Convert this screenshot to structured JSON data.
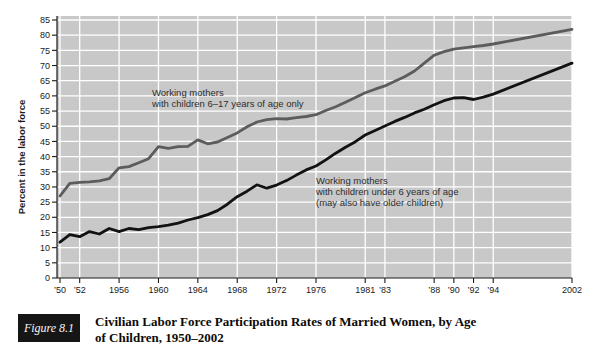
{
  "figure": {
    "label": "Figure 8.1",
    "caption_line1": "Civilian Labor Force Participation Rates of Married Women, by Age",
    "caption_line2": "of Children, 1950–2002"
  },
  "chart_data": {
    "type": "line",
    "title": "",
    "xlabel": "",
    "ylabel": "Percent in the labor force",
    "ylim": [
      0,
      85
    ],
    "yticks": [
      0,
      5,
      10,
      15,
      20,
      25,
      30,
      35,
      40,
      45,
      50,
      55,
      60,
      65,
      70,
      75,
      80,
      85
    ],
    "xlim": [
      1950,
      2002
    ],
    "xticks": [
      {
        "year": 1950,
        "label": "’50"
      },
      {
        "year": 1952,
        "label": "’52"
      },
      {
        "year": 1956,
        "label": "1956"
      },
      {
        "year": 1960,
        "label": "1960"
      },
      {
        "year": 1964,
        "label": "1964"
      },
      {
        "year": 1968,
        "label": "1968"
      },
      {
        "year": 1972,
        "label": "1972"
      },
      {
        "year": 1976,
        "label": "1976"
      },
      {
        "year": 1981,
        "label": "1981"
      },
      {
        "year": 1983,
        "label": "’83"
      },
      {
        "year": 1988,
        "label": "’88"
      },
      {
        "year": 1990,
        "label": "’90"
      },
      {
        "year": 1992,
        "label": "’92"
      },
      {
        "year": 1994,
        "label": "’94"
      },
      {
        "year": 2002,
        "label": "2002"
      }
    ],
    "grid": "white gridlines on gray plot background, horizontal every 5 units, vertical at labeled years",
    "legend_position": "inline annotations on plot",
    "colors": {
      "plot_bg": "#c8c8c8",
      "grid": "#ffffff",
      "axis": "#1a1a1a",
      "annotation_text": "#2e2e2e",
      "caption_box_bg": "#161616",
      "caption_box_text": "#f5f5f5"
    },
    "series": [
      {
        "name": "Working mothers with children 6–17 years of age only",
        "color": "#5c5c5c",
        "points": [
          [
            1950,
            27
          ],
          [
            1951,
            31.2
          ],
          [
            1952,
            31.5
          ],
          [
            1953,
            31.7
          ],
          [
            1954,
            32
          ],
          [
            1955,
            32.7
          ],
          [
            1956,
            36.3
          ],
          [
            1957,
            36.7
          ],
          [
            1958,
            38
          ],
          [
            1959,
            39.3
          ],
          [
            1960,
            43.3
          ],
          [
            1961,
            42.7
          ],
          [
            1962,
            43.3
          ],
          [
            1963,
            43.4
          ],
          [
            1964,
            45.5
          ],
          [
            1965,
            44.2
          ],
          [
            1966,
            44.8
          ],
          [
            1967,
            46.3
          ],
          [
            1968,
            47.8
          ],
          [
            1969,
            49.8
          ],
          [
            1970,
            51.4
          ],
          [
            1971,
            52.2
          ],
          [
            1972,
            52.5
          ],
          [
            1973,
            52.4
          ],
          [
            1974,
            52.8
          ],
          [
            1975,
            53.2
          ],
          [
            1976,
            53.8
          ],
          [
            1977,
            55.2
          ],
          [
            1978,
            56.4
          ],
          [
            1979,
            57.9
          ],
          [
            1980,
            59.5
          ],
          [
            1981,
            61
          ],
          [
            1982,
            62.2
          ],
          [
            1983,
            63.3
          ],
          [
            1984,
            64.8
          ],
          [
            1985,
            66.3
          ],
          [
            1986,
            68.2
          ],
          [
            1987,
            70.8
          ],
          [
            1988,
            73.4
          ],
          [
            1989,
            74.6
          ],
          [
            1990,
            75.4
          ],
          [
            1991,
            75.8
          ],
          [
            1992,
            76.2
          ],
          [
            1993,
            76.6
          ],
          [
            1994,
            77.1
          ],
          [
            2002,
            81.9
          ]
        ]
      },
      {
        "name": "Working mothers with children under 6 years of age (may also have older children)",
        "color": "#121212",
        "points": [
          [
            1950,
            11.8
          ],
          [
            1951,
            14.3
          ],
          [
            1952,
            13.6
          ],
          [
            1953,
            15.3
          ],
          [
            1954,
            14.5
          ],
          [
            1955,
            16.3
          ],
          [
            1956,
            15.3
          ],
          [
            1957,
            16.3
          ],
          [
            1958,
            15.9
          ],
          [
            1959,
            16.6
          ],
          [
            1960,
            16.9
          ],
          [
            1961,
            17.4
          ],
          [
            1962,
            18.1
          ],
          [
            1963,
            19.1
          ],
          [
            1964,
            19.9
          ],
          [
            1965,
            20.9
          ],
          [
            1966,
            22.2
          ],
          [
            1967,
            24.3
          ],
          [
            1968,
            26.8
          ],
          [
            1969,
            28.6
          ],
          [
            1970,
            30.7
          ],
          [
            1971,
            29.6
          ],
          [
            1972,
            30.6
          ],
          [
            1973,
            32.1
          ],
          [
            1974,
            33.9
          ],
          [
            1975,
            35.6
          ],
          [
            1976,
            36.9
          ],
          [
            1977,
            38.9
          ],
          [
            1978,
            41.1
          ],
          [
            1979,
            43.1
          ],
          [
            1980,
            44.9
          ],
          [
            1981,
            47.1
          ],
          [
            1982,
            48.6
          ],
          [
            1983,
            50.1
          ],
          [
            1984,
            51.6
          ],
          [
            1985,
            52.9
          ],
          [
            1986,
            54.4
          ],
          [
            1987,
            55.6
          ],
          [
            1988,
            57.1
          ],
          [
            1989,
            58.4
          ],
          [
            1990,
            59.3
          ],
          [
            1991,
            59.4
          ],
          [
            1992,
            58.8
          ],
          [
            1993,
            59.6
          ],
          [
            1994,
            60.6
          ],
          [
            2002,
            70.8
          ]
        ]
      }
    ],
    "annotations": [
      {
        "series": 0,
        "x_px": 152,
        "y_px": 96,
        "lines": [
          "Working mothers",
          "with children 6–17 years of age only"
        ]
      },
      {
        "series": 1,
        "x_px": 316,
        "y_px": 184,
        "lines": [
          "Working mothers",
          "with children under 6 years of age",
          "(may also have older children)"
        ]
      }
    ]
  }
}
